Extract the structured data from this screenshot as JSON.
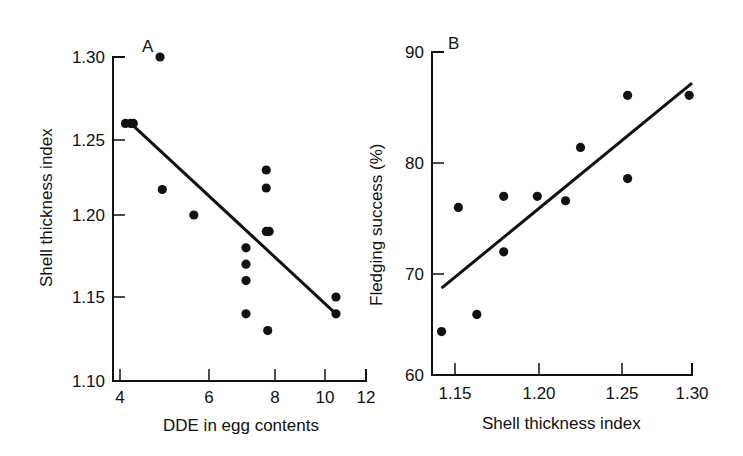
{
  "chart_data": [
    {
      "type": "scatter",
      "panel_label": "A",
      "title": "",
      "xlabel": "DDE in egg contents",
      "ylabel": "Shell thickness index",
      "xscale": "log",
      "xlim": [
        4,
        12
      ],
      "ylim": [
        1.1,
        1.3
      ],
      "xticks": [
        4,
        6,
        8,
        10,
        12
      ],
      "xtick_labels": [
        "4",
        "6",
        "8",
        "10",
        "12"
      ],
      "yticks": [
        1.1,
        1.15,
        1.2,
        1.25,
        1.3
      ],
      "ytick_labels": [
        "1.10",
        "1.15",
        "1.20",
        "1.25",
        "1.30"
      ],
      "grid": false,
      "legend": null,
      "points": [
        {
          "x": 4.1,
          "y": 1.26
        },
        {
          "x": 4.2,
          "y": 1.26
        },
        {
          "x": 4.25,
          "y": 1.26
        },
        {
          "x": 4.8,
          "y": 1.3
        },
        {
          "x": 4.85,
          "y": 1.217
        },
        {
          "x": 5.6,
          "y": 1.2
        },
        {
          "x": 7.05,
          "y": 1.18
        },
        {
          "x": 7.05,
          "y": 1.17
        },
        {
          "x": 7.05,
          "y": 1.16
        },
        {
          "x": 7.05,
          "y": 1.14
        },
        {
          "x": 7.7,
          "y": 1.23
        },
        {
          "x": 7.7,
          "y": 1.218
        },
        {
          "x": 7.7,
          "y": 1.19
        },
        {
          "x": 7.8,
          "y": 1.19
        },
        {
          "x": 7.75,
          "y": 1.13
        },
        {
          "x": 10.5,
          "y": 1.15
        },
        {
          "x": 10.5,
          "y": 1.14
        }
      ],
      "regression_line": {
        "x": [
          4.2,
          10.5
        ],
        "y": [
          1.26,
          1.14
        ]
      }
    },
    {
      "type": "scatter",
      "panel_label": "B",
      "title": "",
      "xlabel": "Shell thickness index",
      "ylabel": "Fledging success (%)",
      "xscale": "linear",
      "xlim": [
        1.135,
        1.3
      ],
      "ylim": [
        60,
        90
      ],
      "xticks": [
        1.15,
        1.2,
        1.25,
        1.3
      ],
      "xtick_labels": [
        "1.15",
        "1.20",
        "1.25",
        "1.30"
      ],
      "yticks": [
        60,
        70,
        80,
        90
      ],
      "ytick_labels": [
        "60",
        "70",
        "80",
        "90"
      ],
      "grid": false,
      "legend": null,
      "points": [
        {
          "x": 1.142,
          "y": 64.3
        },
        {
          "x": 1.152,
          "y": 76.0
        },
        {
          "x": 1.163,
          "y": 66.0
        },
        {
          "x": 1.179,
          "y": 77.0
        },
        {
          "x": 1.179,
          "y": 72.0
        },
        {
          "x": 1.199,
          "y": 77.0
        },
        {
          "x": 1.216,
          "y": 76.6
        },
        {
          "x": 1.225,
          "y": 81.4
        },
        {
          "x": 1.254,
          "y": 86.1
        },
        {
          "x": 1.254,
          "y": 78.6
        },
        {
          "x": 1.298,
          "y": 86.1
        }
      ],
      "regression_line": {
        "x": [
          1.142,
          1.3
        ],
        "y": [
          68.6,
          87.2
        ]
      }
    }
  ]
}
